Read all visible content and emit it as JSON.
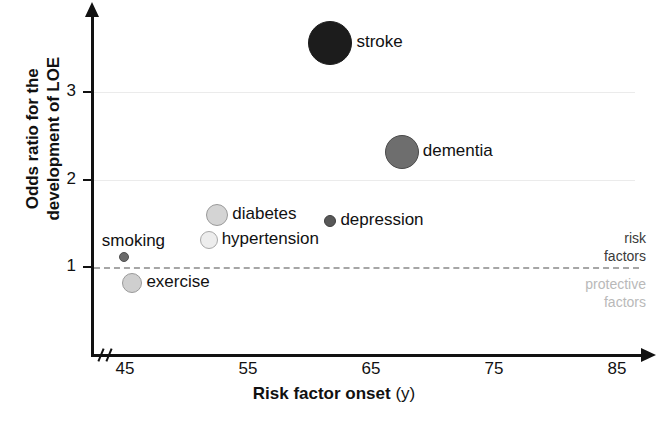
{
  "chart_data": {
    "type": "scatter",
    "title": "",
    "subtitle": "",
    "xlabel_bold": "Risk factor onset",
    "xlabel_plain": "(y)",
    "ylabel_line1": "Odds ratio for the",
    "ylabel_line2": "development of LOE",
    "xlabel": "Risk factor onset (y)",
    "ylabel": "Odds ratio for the development of LOE",
    "xlim": [
      43,
      88
    ],
    "ylim": [
      0.55,
      3.95
    ],
    "xticks": [
      45,
      55,
      65,
      75,
      85
    ],
    "yticks": [
      1,
      2,
      3
    ],
    "xtick_labels": [
      "45",
      "55",
      "65",
      "75",
      "85"
    ],
    "ytick_labels": [
      "1",
      "2",
      "3"
    ],
    "grid": true,
    "gridlines_y": [
      2,
      3
    ],
    "axis_break_x": true,
    "legend_position": "none",
    "reference_line": {
      "y": 1,
      "style": "dashed",
      "color": "#a6a6a6"
    },
    "annotations": [
      {
        "name": "risk-factors",
        "text": "risk\nfactors",
        "color": "#3a3a3a",
        "position": "above-reference-line-right"
      },
      {
        "name": "protective-factors",
        "text": "protective\nfactors",
        "color": "#b9b9b9",
        "position": "below-reference-line-right"
      }
    ],
    "size_encoding": "bubble area ~ relative prevalence / weight",
    "points": [
      {
        "label": "stroke",
        "x": 61.7,
        "y": 3.56,
        "r": 22,
        "color": "#1c1c1c",
        "stroke": "#1c1c1c",
        "label_side": "right"
      },
      {
        "label": "dementia",
        "x": 67.5,
        "y": 2.31,
        "r": 17,
        "color": "#6e6e6e",
        "stroke": "#4a4a4a",
        "label_side": "right"
      },
      {
        "label": "diabetes",
        "x": 52.5,
        "y": 1.6,
        "r": 11,
        "color": "#d4d4d4",
        "stroke": "#9a9a9a",
        "label_side": "right"
      },
      {
        "label": "depression",
        "x": 61.7,
        "y": 1.53,
        "r": 6,
        "color": "#585858",
        "stroke": "#3f3f3f",
        "label_side": "right"
      },
      {
        "label": "hypertension",
        "x": 51.8,
        "y": 1.31,
        "r": 9,
        "color": "#ededed",
        "stroke": "#a8a8a8",
        "label_side": "right"
      },
      {
        "label": "smoking",
        "x": 44.9,
        "y": 1.12,
        "r": 5,
        "color": "#6b6b6b",
        "stroke": "#505050",
        "label_side": "above-left"
      },
      {
        "label": "exercise",
        "x": 45.6,
        "y": 0.82,
        "r": 10,
        "color": "#cfcfcf",
        "stroke": "#9a9a9a",
        "label_side": "right"
      }
    ]
  }
}
